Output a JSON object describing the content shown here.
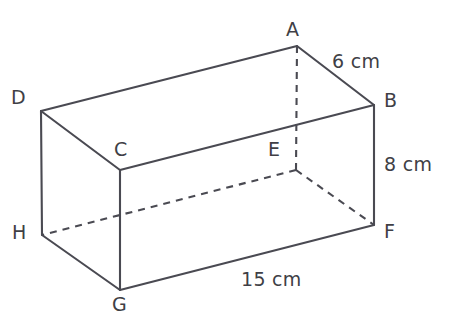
{
  "figure": {
    "type": "cuboid-net-diagram",
    "shape_name": "rectangular prism",
    "background_color": "#ffffff",
    "stroke_color": "#4a4a52",
    "label_color": "#3f3f46",
    "vertices": [
      {
        "name": "A",
        "label": "A",
        "x": 297,
        "y": 46,
        "label_x": 286,
        "label_y": 20,
        "hidden": false
      },
      {
        "name": "B",
        "label": "B",
        "x": 374,
        "y": 105,
        "label_x": 384,
        "label_y": 91,
        "hidden": false
      },
      {
        "name": "C",
        "label": "C",
        "x": 120,
        "y": 170,
        "label_x": 114,
        "label_y": 140,
        "hidden": false
      },
      {
        "name": "D",
        "label": "D",
        "x": 41,
        "y": 111,
        "label_x": 11,
        "label_y": 88,
        "hidden": false
      },
      {
        "name": "E",
        "label": "E",
        "x": 296,
        "y": 170,
        "label_x": 268,
        "label_y": 140,
        "hidden": true
      },
      {
        "name": "F",
        "label": "F",
        "x": 374,
        "y": 225,
        "label_x": 384,
        "label_y": 222,
        "hidden": false
      },
      {
        "name": "G",
        "label": "G",
        "x": 120,
        "y": 290,
        "label_x": 112,
        "label_y": 295,
        "hidden": false
      },
      {
        "name": "H",
        "label": "H",
        "x": 42,
        "y": 235,
        "label_x": 12,
        "label_y": 223,
        "hidden": false
      }
    ],
    "edges_solid": [
      {
        "name": "edge-D-A",
        "from": "D",
        "to": "A"
      },
      {
        "name": "edge-A-B",
        "from": "A",
        "to": "B"
      },
      {
        "name": "edge-D-C",
        "from": "D",
        "to": "C"
      },
      {
        "name": "edge-C-B",
        "from": "C",
        "to": "B"
      },
      {
        "name": "edge-D-H",
        "from": "D",
        "to": "H"
      },
      {
        "name": "edge-C-G",
        "from": "C",
        "to": "G"
      },
      {
        "name": "edge-B-F",
        "from": "B",
        "to": "F"
      },
      {
        "name": "edge-H-G",
        "from": "H",
        "to": "G"
      },
      {
        "name": "edge-G-F",
        "from": "G",
        "to": "F"
      }
    ],
    "edges_dashed": [
      {
        "name": "edge-A-E",
        "from": "A",
        "to": "E"
      },
      {
        "name": "edge-E-H",
        "from": "E",
        "to": "H"
      },
      {
        "name": "edge-E-F",
        "from": "E",
        "to": "F"
      }
    ],
    "dimensions": [
      {
        "name": "depth",
        "text": "6 cm",
        "x": 332,
        "y": 52,
        "measures": "A-B"
      },
      {
        "name": "height",
        "text": "8 cm",
        "x": 384,
        "y": 155,
        "measures": "B-F"
      },
      {
        "name": "length",
        "text": "15 cm",
        "x": 241,
        "y": 270,
        "measures": "G-F"
      }
    ]
  }
}
